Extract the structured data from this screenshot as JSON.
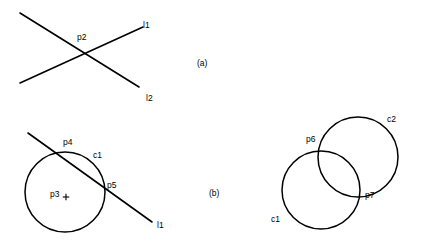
{
  "figure": {
    "background_color": "#ffffff",
    "stroke_color": "#000000",
    "width": 448,
    "height": 250,
    "caption_labels": [
      {
        "id": "subfig-a",
        "text": "(a)",
        "x": 197,
        "y": 59
      },
      {
        "id": "subfig-b",
        "text": "(b)",
        "x": 209,
        "y": 189
      }
    ]
  },
  "panel_a": {
    "name": "two-intersecting-lines",
    "lines": [
      {
        "id": "l1",
        "x1": 20,
        "y1": 13,
        "x2": 139,
        "y2": 87
      },
      {
        "id": "l2",
        "x1": 20,
        "y1": 83,
        "x2": 143,
        "y2": 27
      }
    ],
    "labels": [
      {
        "id": "p2",
        "text": "p2",
        "x": 77,
        "y": 33
      },
      {
        "id": "l1",
        "text": "l1",
        "x": 143,
        "y": 21
      },
      {
        "id": "l2",
        "text": "l2",
        "x": 146,
        "y": 94
      }
    ]
  },
  "panel_b_left": {
    "name": "circle-line-intersection",
    "circle": {
      "id": "c1",
      "cx": 65,
      "cy": 192,
      "r": 40
    },
    "center_point": {
      "id": "p3",
      "x": 66,
      "y": 197
    },
    "line": {
      "id": "l1",
      "x1": 28,
      "y1": 133,
      "x2": 152,
      "y2": 222
    },
    "labels": [
      {
        "id": "p4",
        "text": "p4",
        "x": 63,
        "y": 138
      },
      {
        "id": "c1",
        "text": "c1",
        "x": 93,
        "y": 151
      },
      {
        "id": "p3",
        "text": "p3",
        "x": 50,
        "y": 190
      },
      {
        "id": "p5",
        "text": "p5",
        "x": 107,
        "y": 181
      },
      {
        "id": "l1",
        "text": "l1",
        "x": 157,
        "y": 221
      }
    ]
  },
  "panel_b_right": {
    "name": "two-intersecting-circles",
    "circles": [
      {
        "id": "c1",
        "cx": 321,
        "cy": 190,
        "r": 39
      },
      {
        "id": "c2",
        "cx": 358,
        "cy": 157,
        "r": 40
      }
    ],
    "labels": [
      {
        "id": "c2",
        "text": "c2",
        "x": 387,
        "y": 115
      },
      {
        "id": "p6",
        "text": "p6",
        "x": 306,
        "y": 135
      },
      {
        "id": "p7",
        "text": "p7",
        "x": 365,
        "y": 191
      },
      {
        "id": "c1",
        "text": "c1",
        "x": 271,
        "y": 215
      }
    ]
  }
}
